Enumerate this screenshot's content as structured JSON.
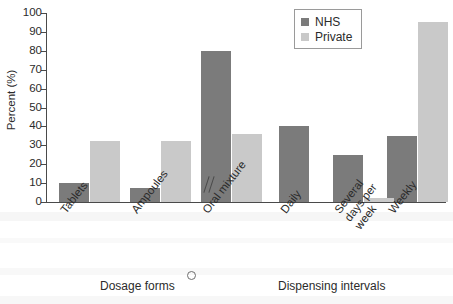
{
  "chart_data": {
    "type": "bar",
    "title": "",
    "xlabel": "",
    "ylabel": "Percent (%)",
    "ylim": [
      0,
      100
    ],
    "ytick_step": 10,
    "yticks": [
      0,
      10,
      20,
      30,
      40,
      50,
      60,
      70,
      80,
      90,
      100
    ],
    "grid": false,
    "legend_position": "top-right",
    "axis_break": true,
    "axis_break_note": "broken x-axis between the two category groups",
    "legend": [
      "NHS",
      "Private"
    ],
    "series": [
      {
        "name": "NHS",
        "color": "#7b7b7b",
        "values": [
          10,
          7.5,
          80,
          40,
          25,
          35
        ]
      },
      {
        "name": "Private",
        "color": "#c9c9c9",
        "values": [
          32.5,
          32.5,
          36,
          0,
          2,
          95
        ]
      }
    ],
    "categories": [
      "Tablets",
      "Ampoules",
      "Oral mixture",
      "Daily",
      "Several days per week",
      "Weekly"
    ],
    "category_label_lines": [
      [
        "Tablets"
      ],
      [
        "Ampoules"
      ],
      [
        "Oral mixture"
      ],
      [
        "Daily"
      ],
      [
        "Several",
        "days per",
        "week"
      ],
      [
        "Weekly"
      ]
    ],
    "groups": [
      {
        "title": "Dosage forms",
        "categories": [
          "Tablets",
          "Ampoules",
          "Oral mixture"
        ]
      },
      {
        "title": "Dispensing intervals",
        "categories": [
          "Daily",
          "Several days per week",
          "Weekly"
        ]
      }
    ]
  },
  "colors": {
    "nhs": "#7b7b7b",
    "private": "#c9c9c9",
    "axis": "#4a4a4a",
    "text": "#2b2b2b",
    "background": "#ffffff"
  }
}
